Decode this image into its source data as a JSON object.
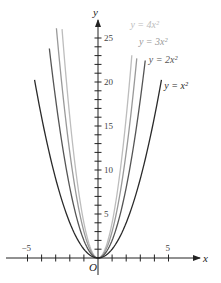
{
  "chart_data": {
    "type": "line",
    "title": "",
    "xlabel": "x",
    "ylabel": "y",
    "origin_label": "O",
    "xlim": [
      -6.8,
      8.5
    ],
    "ylim": [
      -2,
      27
    ],
    "x_ticks": [
      -5,
      5
    ],
    "y_ticks": [
      5,
      10,
      15,
      20,
      25
    ],
    "grid": false,
    "legend_position": "inline labels near curve ends (upper right)",
    "series": [
      {
        "name": "y = x²",
        "coefficient": 1,
        "color": "#2a2a2a",
        "x_range": [
          -4.5,
          4.5
        ],
        "label_x": 4.7,
        "label_y": 19.5
      },
      {
        "name": "y = 2x²",
        "coefficient": 2,
        "color": "#555555",
        "x_range": [
          -3.45,
          3.35
        ],
        "label_x": 3.6,
        "label_y": 22.5
      },
      {
        "name": "y = 3x²",
        "coefficient": 3,
        "color": "#999999",
        "x_range": [
          -2.95,
          2.75
        ],
        "label_x": 2.9,
        "label_y": 24.5
      },
      {
        "name": "y = 4x²",
        "coefficient": 4,
        "color": "#bdbdbd",
        "x_range": [
          -2.55,
          2.4
        ],
        "label_x": 2.3,
        "label_y": 26.5
      }
    ]
  },
  "labels": {
    "x_axis": "x",
    "y_axis": "y",
    "origin": "O",
    "tick_neg5": "−5",
    "tick_5": "5",
    "ytick_5": "5",
    "ytick_10": "10",
    "ytick_15": "15",
    "ytick_20": "20",
    "ytick_25": "25",
    "curve_1": "y = x²",
    "curve_2": "y = 2x²",
    "curve_3": "y = 3x²",
    "curve_4": "y = 4x²"
  }
}
